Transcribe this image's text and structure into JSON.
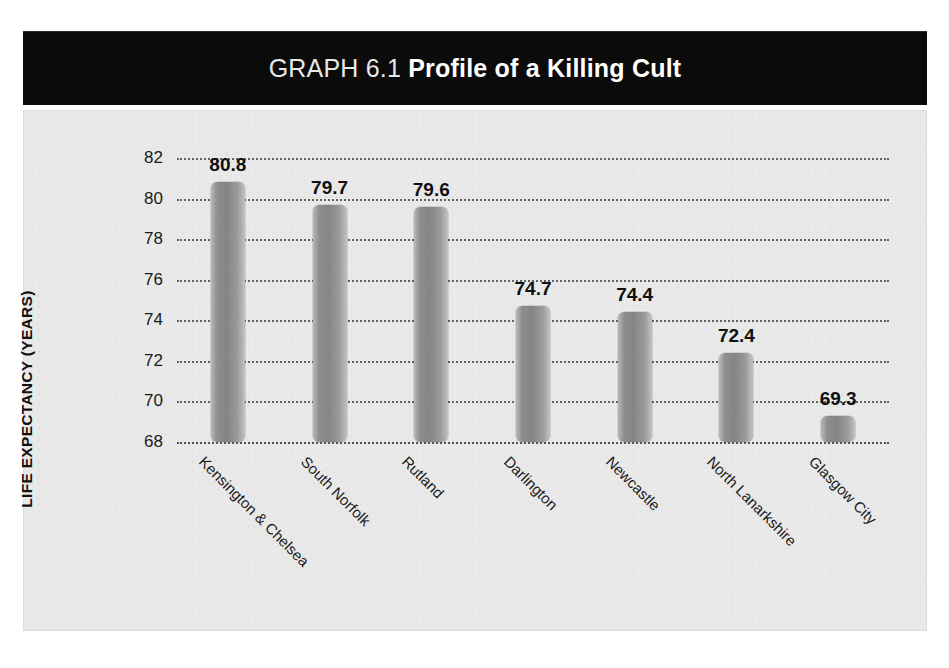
{
  "title": {
    "prefix": "GRAPH 6.1",
    "main": "Profile of a Killing Cult",
    "full": "GRAPH 6.1 Profile of a Killing Cult"
  },
  "colors": {
    "banner_background": "#0b0b0b",
    "banner_text": "#ffffff",
    "panel_background": "#e9e9e9",
    "bar_fill_light": "#c2c2c2",
    "bar_fill_dark": "#858585",
    "gridline": "#4a4a4a",
    "text": "#111111"
  },
  "chart_data": {
    "type": "bar",
    "xlabel": "",
    "ylabel": "LIFE EXPECTANCY (YEARS)",
    "ylim": [
      68,
      82
    ],
    "ytick_labels": [
      "82",
      "80",
      "78",
      "76",
      "74",
      "72",
      "70",
      "68"
    ],
    "yticks": [
      82,
      80,
      78,
      76,
      74,
      72,
      70,
      68
    ],
    "grid": true,
    "grid_style": "dotted-horizontal",
    "legend": "none",
    "categories": [
      "Kensington & Chelsea",
      "South Norfolk",
      "Rutland",
      "Darlington",
      "Newcastle",
      "North Lanarkshire",
      "Glasgow City"
    ],
    "values": [
      80.8,
      79.7,
      79.6,
      74.7,
      74.4,
      72.4,
      69.3
    ],
    "data_labels": [
      "80.8",
      "79.7",
      "79.6",
      "74.7",
      "74.4",
      "72.4",
      "69.3"
    ]
  }
}
